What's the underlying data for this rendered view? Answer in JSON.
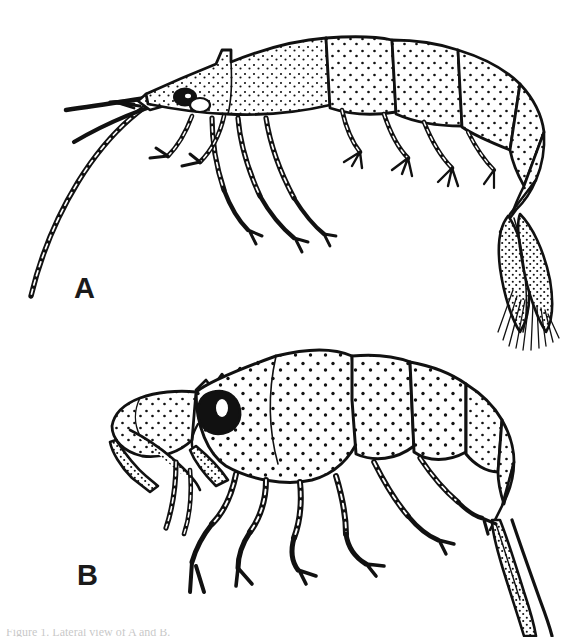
{
  "figure": {
    "background_color": "#ffffff",
    "ink_color": "#111111",
    "width": 579,
    "height": 637,
    "medium": "stippled pen-and-ink scientific illustration",
    "panels": [
      {
        "id": "A",
        "label": "A",
        "label_x": 74,
        "label_y": 274,
        "subject": "slender shrimp in left lateral view",
        "orientation": "head at left, tail fan at lower right",
        "features": [
          "long pointed rostrum",
          "dark pigmented eye",
          "two long flagellate antennae sweeping down and left",
          "five pairs of slender stippled pereiopods",
          "six stippled abdominal somites",
          "telson and uropods forming a fringed tail fan with fine setae"
        ]
      },
      {
        "id": "B",
        "label": "B",
        "label_x": 77,
        "label_y": 561,
        "subject": "robust stout shrimp in left lateral view",
        "orientation": "head at left, tail at lower right",
        "features": [
          "short serrated rostrum with dorsal teeth",
          "large prominent stalked eye",
          "heavy stippled carapace",
          "stout segmented mouthparts and maxillipeds",
          "short thick stippled walking legs",
          "broad stippled abdominal somites",
          "narrow tapering tail extending past the lower right edge"
        ]
      }
    ],
    "caption": {
      "visible": true,
      "cropped": true,
      "text": "Figure 1. Lateral view of A and B."
    }
  }
}
